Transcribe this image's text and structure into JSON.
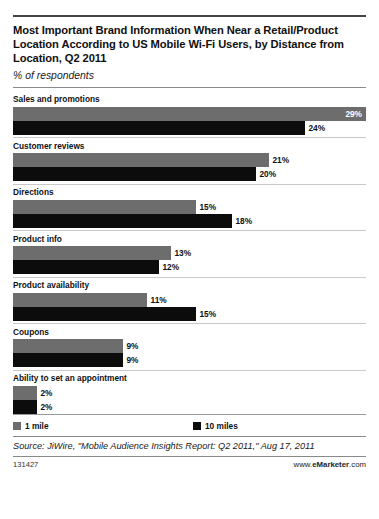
{
  "header": {
    "title": "Most Important Brand Information When Near a Retail/Product Location According to US Mobile Wi-Fi Users, by Distance from Location, Q2 2011",
    "subtitle": "% of respondents"
  },
  "legend": {
    "series1": "1 mile",
    "series2": "10 miles"
  },
  "footer": {
    "source": "Source: JiWire, \"Mobile Audience Insights Report: Q2 2011,\" Aug 17, 2011",
    "id": "131427",
    "brand_prefix": "www.",
    "brand_name": "eMarketer",
    "brand_suffix": ".com"
  },
  "chart_data": {
    "type": "bar",
    "orientation": "horizontal",
    "title": "Most Important Brand Information When Near a Retail/Product Location According to US Mobile Wi-Fi Users, by Distance from Location, Q2 2011",
    "subtitle": "% of respondents",
    "xlabel": "",
    "ylabel": "",
    "unit": "%",
    "xlim": [
      0,
      29
    ],
    "grid": false,
    "legend_position": "bottom",
    "categories": [
      "Sales and promotions",
      "Customer reviews",
      "Directions",
      "Product info",
      "Product availability",
      "Coupons",
      "Ability to set an appointment"
    ],
    "series": [
      {
        "name": "1 mile",
        "color": "#6d6d6d",
        "values": [
          29,
          21,
          15,
          13,
          11,
          9,
          2
        ],
        "labels": [
          "29%",
          "21%",
          "15%",
          "13%",
          "11%",
          "9%",
          "2%"
        ]
      },
      {
        "name": "10 miles",
        "color": "#0c0c0c",
        "values": [
          24,
          20,
          18,
          12,
          15,
          9,
          2
        ],
        "labels": [
          "24%",
          "20%",
          "18%",
          "12%",
          "15%",
          "9%",
          "2%"
        ]
      }
    ],
    "groups": [
      {
        "label": "Sales and promotions",
        "bars": [
          {
            "series": "1 mile",
            "value": 29,
            "label": "29%",
            "label_placement": "inside"
          },
          {
            "series": "10 miles",
            "value": 24,
            "label": "24%",
            "label_placement": "outside"
          }
        ]
      },
      {
        "label": "Customer reviews",
        "bars": [
          {
            "series": "1 mile",
            "value": 21,
            "label": "21%",
            "label_placement": "outside"
          },
          {
            "series": "10 miles",
            "value": 20,
            "label": "20%",
            "label_placement": "outside"
          }
        ]
      },
      {
        "label": "Directions",
        "bars": [
          {
            "series": "1 mile",
            "value": 15,
            "label": "15%",
            "label_placement": "outside"
          },
          {
            "series": "10 miles",
            "value": 18,
            "label": "18%",
            "label_placement": "outside"
          }
        ]
      },
      {
        "label": "Product info",
        "bars": [
          {
            "series": "1 mile",
            "value": 13,
            "label": "13%",
            "label_placement": "outside"
          },
          {
            "series": "10 miles",
            "value": 12,
            "label": "12%",
            "label_placement": "outside"
          }
        ]
      },
      {
        "label": "Product availability",
        "bars": [
          {
            "series": "1 mile",
            "value": 11,
            "label": "11%",
            "label_placement": "outside"
          },
          {
            "series": "10 miles",
            "value": 15,
            "label": "15%",
            "label_placement": "outside"
          }
        ]
      },
      {
        "label": "Coupons",
        "bars": [
          {
            "series": "1 mile",
            "value": 9,
            "label": "9%",
            "label_placement": "outside"
          },
          {
            "series": "10 miles",
            "value": 9,
            "label": "9%",
            "label_placement": "outside"
          }
        ]
      },
      {
        "label": "Ability to set an appointment",
        "bars": [
          {
            "series": "1 mile",
            "value": 2,
            "label": "2%",
            "label_placement": "outside"
          },
          {
            "series": "10 miles",
            "value": 2,
            "label": "2%",
            "label_placement": "outside"
          }
        ]
      }
    ]
  }
}
